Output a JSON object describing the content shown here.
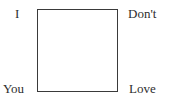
{
  "diagram": {
    "shape": "square",
    "stroke_color": "#3a3a3a",
    "fill_color": "#ffffff",
    "corner_labels": {
      "top_left": "I",
      "top_right": "Don't",
      "bottom_left": "You",
      "bottom_right": "Love"
    }
  }
}
